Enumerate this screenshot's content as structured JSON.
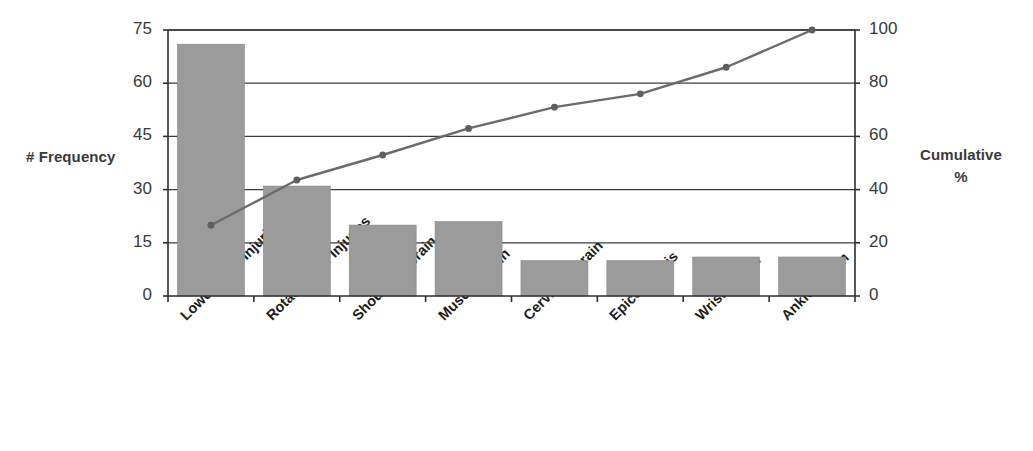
{
  "chart_data": {
    "type": "bar",
    "title": "",
    "subtitle": "",
    "xlabel": "",
    "ylabel": "# Frequency",
    "y2label": "Cumulative\n%",
    "ylabel_line1": "Cumulative",
    "ylabel_line2": "%",
    "categories": [
      "Lower Back Injuries",
      "Rotator Cuff Injuries",
      "Shoulder Sprain",
      "Muscle Strain",
      "Cervical Sprain",
      "Epicondylitis",
      "Wrist Sprain",
      "Ankle Sprain"
    ],
    "series": [
      {
        "name": "# Frequency",
        "type": "bar",
        "axis": "left",
        "values": [
          71,
          31,
          20,
          21,
          10,
          10,
          11,
          11
        ],
        "color": "#9b9b9b"
      },
      {
        "name": "Cumulative %",
        "type": "line",
        "axis": "right",
        "values": [
          26.6,
          43.6,
          53.0,
          63.0,
          71.0,
          76.0,
          86.0,
          100.0
        ],
        "color": "#6b6b6b"
      }
    ],
    "ylim": [
      0,
      75
    ],
    "y2lim": [
      0,
      100
    ],
    "yticks": [
      0,
      15,
      30,
      45,
      60,
      75
    ],
    "y2ticks": [
      0,
      20,
      40,
      60,
      80,
      100
    ],
    "ytick_labels": [
      "0",
      "15",
      "30",
      "45",
      "60",
      "75"
    ],
    "y2tick_labels": [
      "0",
      "20",
      "40",
      "60",
      "80",
      "100"
    ],
    "grid": true,
    "grid_axis": "y",
    "legend": false,
    "legend_position": "none",
    "background": "#ffffff"
  }
}
